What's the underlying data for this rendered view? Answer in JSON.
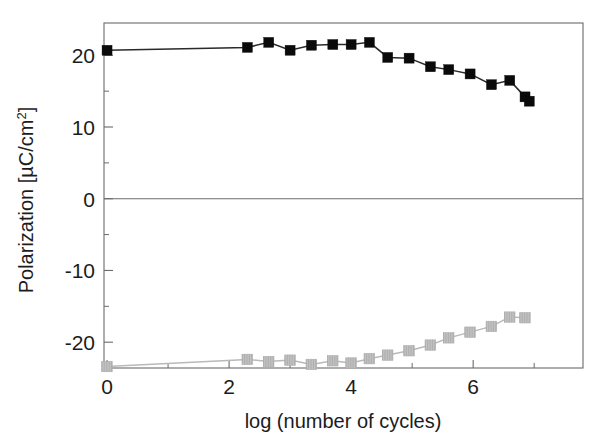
{
  "chart_data": {
    "type": "scatter",
    "title": "",
    "xlabel": "log (number of cycles)",
    "ylabel": "Polarization  [µC/cm²]",
    "ylabel_main": "Polarization  [µC/cm",
    "ylabel_sup": "2",
    "ylabel_tail": "]",
    "xlim": [
      -0.05,
      7.8
    ],
    "ylim": [
      -23.6,
      24.5
    ],
    "grid": false,
    "legend": null,
    "xticks": [
      0,
      2,
      4,
      6
    ],
    "xticklabels": [
      "0",
      "2",
      "4",
      "6"
    ],
    "xminorticks": [
      1,
      3,
      5,
      7
    ],
    "yticks": [
      20,
      10,
      0,
      -10,
      -20
    ],
    "yticklabels": [
      "20",
      "10",
      "0",
      "-10",
      "-20"
    ],
    "yminorticks": [
      15,
      5,
      -5,
      -15
    ],
    "series": [
      {
        "name": "positive-remanent-polarization",
        "marker": "filled-square",
        "color": "#0a0a0a",
        "line_color": "#2a2a2a",
        "x": [
          0.0,
          2.3,
          2.65,
          3.0,
          3.35,
          3.7,
          4.0,
          4.3,
          4.6,
          4.95,
          5.3,
          5.6,
          5.95,
          6.3,
          6.6,
          6.85,
          6.92
        ],
        "y": [
          20.7,
          21.1,
          21.8,
          20.7,
          21.4,
          21.5,
          21.5,
          21.8,
          19.7,
          19.6,
          18.4,
          18.0,
          17.4,
          15.9,
          16.5,
          14.2,
          13.6
        ]
      },
      {
        "name": "negative-remanent-polarization",
        "marker": "hatched-square",
        "color": "#c2c2c2",
        "line_color": "#b9b9b9",
        "x": [
          0.0,
          2.3,
          2.65,
          3.0,
          3.35,
          3.7,
          4.0,
          4.3,
          4.6,
          4.95,
          5.3,
          5.6,
          5.95,
          6.3,
          6.6,
          6.85
        ],
        "y": [
          -23.4,
          -22.4,
          -22.7,
          -22.5,
          -23.1,
          -22.6,
          -22.9,
          -22.3,
          -21.8,
          -21.2,
          -20.4,
          -19.4,
          -18.6,
          -17.8,
          -16.5,
          -16.6
        ]
      }
    ]
  },
  "figure": {
    "plot_left": 104,
    "plot_right": 583,
    "plot_top": 23,
    "plot_bottom": 368
  }
}
